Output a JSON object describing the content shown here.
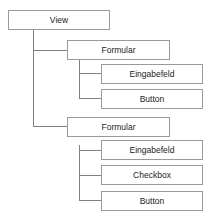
{
  "tree": {
    "root": {
      "label": "View"
    },
    "children": [
      {
        "label": "Formular",
        "children": [
          {
            "label": "Eingabefeld"
          },
          {
            "label": "Button"
          }
        ]
      },
      {
        "label": "Formular",
        "children": [
          {
            "label": "Eingabefeld"
          },
          {
            "label": "Checkbox"
          },
          {
            "label": "Button"
          }
        ]
      }
    ]
  },
  "colors": {
    "border": "#9a9a9a",
    "connector": "#808080"
  }
}
